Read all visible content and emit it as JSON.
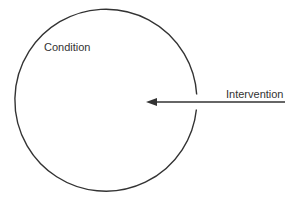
{
  "diagram": {
    "type": "circle-with-incoming-arrow",
    "colors": {
      "background": "#ffffff",
      "stroke": "#333333",
      "text": "#333333"
    },
    "circle": {
      "label": "Condition",
      "cx": 106,
      "cy": 102,
      "r": 91
    },
    "arrow": {
      "label": "Intervention",
      "direction": "right-to-left",
      "x_start": 285,
      "x_end": 146,
      "y": 102
    }
  }
}
